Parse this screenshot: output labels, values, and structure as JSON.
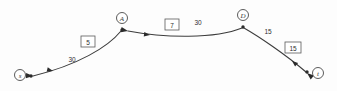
{
  "diagram": {
    "background_color": "#fdfdfd",
    "line_color": "#3c3c3c",
    "nodes": [
      {
        "id": "s",
        "label": "s",
        "cx": 20,
        "cy": 75,
        "r": 5.5,
        "dot_x": 31,
        "dot_y": 76
      },
      {
        "id": "A",
        "label": "A",
        "cx": 122,
        "cy": 18,
        "r": 5.5,
        "dot_x": 122,
        "dot_y": 30
      },
      {
        "id": "D",
        "label": "D",
        "cx": 243,
        "cy": 15,
        "r": 5.5,
        "dot_x": 243,
        "dot_y": 27
      },
      {
        "id": "t",
        "label": "t",
        "cx": 318,
        "cy": 73,
        "r": 5.5,
        "dot_x": 307,
        "dot_y": 72
      }
    ],
    "edges": [
      {
        "id": "A-to-s",
        "from": "A",
        "to": "s",
        "plain_label": "30",
        "boxed_label": "5",
        "plain_label_x": 72,
        "plain_label_y": 59,
        "boxed_label_x": 88,
        "boxed_label_y": 42,
        "arrow_tip_x": 33,
        "arrow_tip_y": 76,
        "arrow_angle": 183,
        "mid_arrow_x": 53,
        "mid_arrow_y": 71,
        "mid_arrow_angle": 196
      },
      {
        "id": "D-to-A",
        "from": "D",
        "to": "A",
        "plain_label": "30",
        "boxed_label": "7",
        "plain_label_x": 198,
        "plain_label_y": 23,
        "boxed_label_x": 172,
        "boxed_label_y": 25,
        "arrow_tip_x": 128,
        "arrow_tip_y": 31,
        "arrow_angle": 193,
        "mid_arrow_x": 150,
        "mid_arrow_y": 35,
        "mid_arrow_angle": 188
      },
      {
        "id": "D-to-t",
        "from": "D",
        "to": "t",
        "plain_label": "15",
        "boxed_label": "15",
        "plain_label_x": 268,
        "plain_label_y": 32,
        "boxed_label_x": 293,
        "boxed_label_y": 48,
        "arrow_tip_x": 306,
        "arrow_tip_y": 72,
        "arrow_angle": 52,
        "mid_arrow_x": 292,
        "mid_arrow_y": 62,
        "mid_arrow_angle": 46
      }
    ]
  }
}
